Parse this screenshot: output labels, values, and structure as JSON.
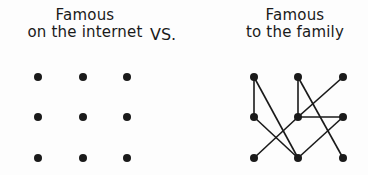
{
  "left": {
    "title_line1": "Famous",
    "title_line2": "on the internet"
  },
  "separator": "VS.",
  "right": {
    "title_line1": "Famous",
    "title_line2": "to the family"
  },
  "grid": {
    "left_nodes": [
      [
        38,
        77
      ],
      [
        83,
        77
      ],
      [
        127,
        77
      ],
      [
        38,
        117
      ],
      [
        83,
        117
      ],
      [
        127,
        117
      ],
      [
        38,
        158
      ],
      [
        83,
        158
      ],
      [
        127,
        158
      ]
    ],
    "right_nodes": [
      [
        254,
        77
      ],
      [
        298,
        77
      ],
      [
        343,
        77
      ],
      [
        254,
        117
      ],
      [
        298,
        117
      ],
      [
        343,
        117
      ],
      [
        254,
        158
      ],
      [
        298,
        158
      ],
      [
        343,
        158
      ]
    ],
    "right_edges": [
      [
        0,
        3
      ],
      [
        0,
        7
      ],
      [
        3,
        7
      ],
      [
        1,
        4
      ],
      [
        1,
        8
      ],
      [
        2,
        4
      ],
      [
        4,
        6
      ],
      [
        4,
        5
      ],
      [
        5,
        7
      ]
    ]
  },
  "colors": {
    "ink": "#1a1a1a",
    "background": "#fdfdfd"
  }
}
